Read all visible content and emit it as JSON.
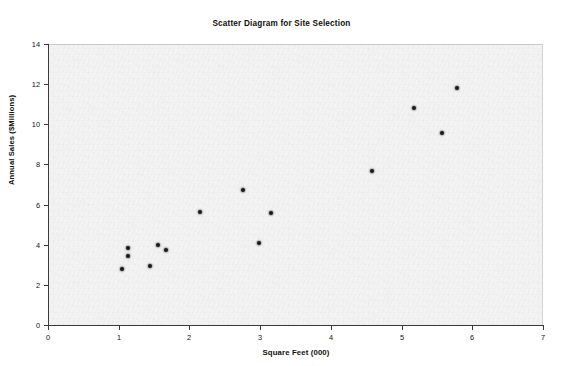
{
  "chart_data": {
    "type": "scatter",
    "title": "Scatter Diagram for Site Selection",
    "xlabel": "Square Feet (000)",
    "ylabel": "Annual Sales ($Millions)",
    "xlim": [
      0,
      7
    ],
    "ylim": [
      0,
      14
    ],
    "xticks": [
      0,
      1,
      2,
      3,
      4,
      5,
      6,
      7
    ],
    "yticks": [
      0,
      2,
      4,
      6,
      8,
      10,
      12,
      14
    ],
    "xtick_labels": [
      "0",
      "1",
      "2",
      "3",
      "4",
      "5",
      "6",
      "7"
    ],
    "ytick_labels": [
      "0",
      "2",
      "4",
      "6",
      "8",
      "10",
      "12",
      "14"
    ],
    "grid": false,
    "legend": false,
    "marker": "filled-circle",
    "marker_color": "#1a1a1a",
    "plot_background": "#f3f3f3",
    "series": [
      {
        "name": "Sites",
        "points": [
          {
            "x": 1.05,
            "y": 2.8
          },
          {
            "x": 1.13,
            "y": 3.85
          },
          {
            "x": 1.13,
            "y": 3.45
          },
          {
            "x": 1.44,
            "y": 2.95
          },
          {
            "x": 1.56,
            "y": 4.0
          },
          {
            "x": 1.67,
            "y": 3.75
          },
          {
            "x": 2.15,
            "y": 5.65
          },
          {
            "x": 2.76,
            "y": 6.75
          },
          {
            "x": 2.98,
            "y": 4.1
          },
          {
            "x": 3.15,
            "y": 5.6
          },
          {
            "x": 4.58,
            "y": 7.65
          },
          {
            "x": 5.18,
            "y": 10.8
          },
          {
            "x": 5.57,
            "y": 9.55
          },
          {
            "x": 5.78,
            "y": 11.8
          }
        ]
      }
    ]
  }
}
